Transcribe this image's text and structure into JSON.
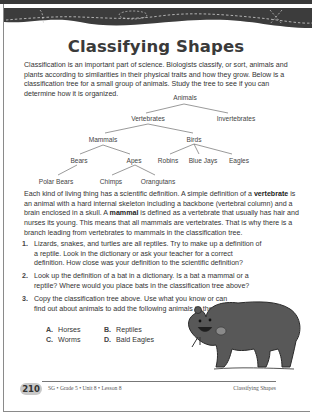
{
  "page": {
    "title": "Classifying Shapes",
    "intro": "Classification is an important part of science. Biologists classify, or sort, animals and plants according to similarities in their physical traits and how they grow. Below is a classification tree for a small group of animals. Study the tree to see if you can determine how it is organized.",
    "tree": {
      "root": "Animals",
      "level1": [
        "Vertebrates",
        "Invertebrates"
      ],
      "level2": [
        "Mammals",
        "Birds"
      ],
      "level3": [
        "Bears",
        "Apes",
        "Robins",
        "Blue Jays",
        "Eagles"
      ],
      "level4": [
        "Polar Bears",
        "Chimps",
        "Orangutans"
      ]
    },
    "definition": {
      "part1": "Each kind of living thing has a scientific definition. A simple definition of a ",
      "term1": "vertebrate",
      "part2": " is an animal with a hard internal skeleton including a backbone (vertebral column) and a brain enclosed in a skull. A ",
      "term2": "mammal",
      "part3": " is defined as a vertebrate that usually has hair and nurses its young. This means that all mammals are vertebrates. That is why there is a branch leading from vertebrates to mammals in the classification tree."
    },
    "questions": [
      {
        "num": "1.",
        "text": "Lizards, snakes, and turtles are all reptiles. Try to make up a definition of a reptile. Look in the dictionary or ask your teacher for a correct definition. How close was your definition to the scientific definition?"
      },
      {
        "num": "2.",
        "text": "Look up the definition of a bat in a dictionary. Is a bat a mammal or a reptile? Where would you place bats in the classification tree above?"
      },
      {
        "num": "3.",
        "text": "Copy the classification tree above. Use what you know or can find out about animals to add the following animals to the tree."
      }
    ],
    "options": [
      {
        "letter": "A.",
        "label": "Horses"
      },
      {
        "letter": "B.",
        "label": "Reptiles"
      },
      {
        "letter": "C.",
        "label": "Worms"
      },
      {
        "letter": "D.",
        "label": "Bald Eagles"
      }
    ],
    "illustration": "bear-illustration",
    "footer": {
      "page_number": "210",
      "course": "SG • Grade 5 • Unit 8 • Lesson 8",
      "section": "Classifying Shapes"
    }
  }
}
